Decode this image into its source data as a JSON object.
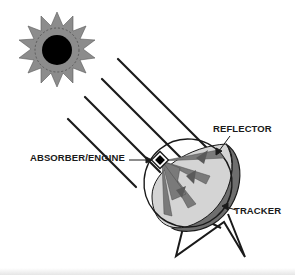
{
  "diagram": {
    "labels": {
      "reflector": "REFLECTOR",
      "absorber_engine": "ABSORBER/ENGINE",
      "tracker": "TRACKER"
    },
    "components": [
      {
        "id": "sun",
        "type": "sun-icon"
      },
      {
        "id": "rays",
        "type": "incoming-sunlight",
        "count": 4
      },
      {
        "id": "reflector",
        "type": "parabolic-dish"
      },
      {
        "id": "absorber",
        "type": "receiver-box"
      },
      {
        "id": "tracker",
        "type": "tripod-stand"
      }
    ],
    "colors": {
      "sun_rays": "#8c8c8c",
      "sun_core": "#000000",
      "dish_inner": "#d4d4d4",
      "dish_rim": "#6e6e6e",
      "reflected_rays": "#7a7a7a",
      "lines": "#1a1a1a"
    }
  }
}
